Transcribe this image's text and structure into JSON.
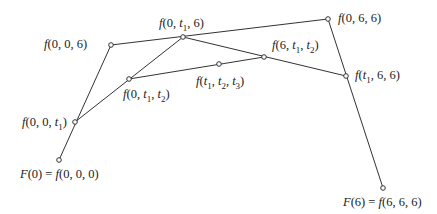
{
  "diagram": {
    "line_color": "#333333",
    "point_fill": "#ffffff",
    "points": [
      {
        "id": "p000",
        "x": 59,
        "y": 160,
        "label": "F(0) = f(0, 0, 0)"
      },
      {
        "id": "p00t1",
        "x": 75,
        "y": 122,
        "label": "f(0, 0, t1)"
      },
      {
        "id": "p006",
        "x": 111,
        "y": 45,
        "label": "f(0, 0, 6)"
      },
      {
        "id": "p0t1t2",
        "x": 129,
        "y": 79,
        "label": "f(0, t1, t2)"
      },
      {
        "id": "p0t16",
        "x": 183,
        "y": 37,
        "label": "f(0, t1, 6)"
      },
      {
        "id": "pt1t2t3",
        "x": 219,
        "y": 64,
        "label": "f(t1, t2, t3)"
      },
      {
        "id": "p6t1t2",
        "x": 264,
        "y": 57,
        "label": "f(6, t1, t2)"
      },
      {
        "id": "p066",
        "x": 328,
        "y": 19,
        "label": "f(0, 6, 6)"
      },
      {
        "id": "pt166",
        "x": 346,
        "y": 76,
        "label": "f(t1, 6, 6)"
      },
      {
        "id": "p666",
        "x": 383,
        "y": 188,
        "label": "F(6) = f(6, 6, 6)"
      }
    ],
    "edges": [
      [
        "p000",
        "p006"
      ],
      [
        "p006",
        "p066"
      ],
      [
        "p066",
        "p666"
      ],
      [
        "p00t1",
        "p0t16"
      ],
      [
        "p0t16",
        "pt166"
      ],
      [
        "p0t1t2",
        "p6t1t2"
      ]
    ]
  }
}
